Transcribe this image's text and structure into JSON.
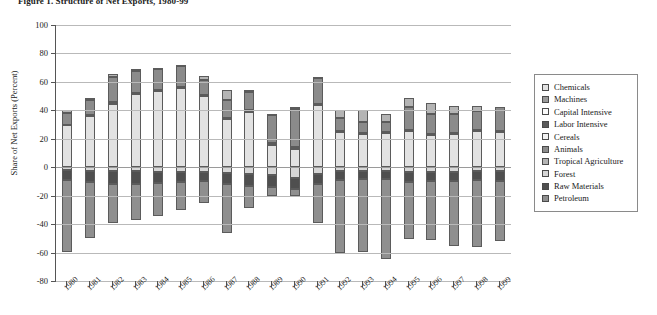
{
  "figure": {
    "title": "Figure 1. Structure of Net Exports, 1980-99"
  },
  "chart_data": {
    "type": "bar",
    "stacked": true,
    "title": "Figure 1. Structure of Net Exports, 1980-99",
    "xlabel": "",
    "ylabel": "Share of Net Exports (Percent)",
    "ylim": [
      -80,
      100
    ],
    "ytick_labels": [
      "100",
      "80",
      "60",
      "40",
      "20",
      "0",
      "-20",
      "-40",
      "-60",
      "-80"
    ],
    "yticks": [
      100,
      80,
      60,
      40,
      20,
      0,
      -20,
      -40,
      -60,
      -80
    ],
    "grid": true,
    "legend_position": "right",
    "categories": [
      "1980",
      "1981",
      "1982",
      "1983",
      "1984",
      "1985",
      "1986",
      "1987",
      "1988",
      "1989",
      "1990",
      "1991",
      "1992",
      "1993",
      "1994",
      "1995",
      "1996",
      "1997",
      "1998",
      "1999"
    ],
    "series": [
      {
        "name": "Chemicals",
        "color": "#e2e2e2",
        "values": [
          29.5,
          36.5,
          44.5,
          52.0,
          53.5,
          55.5,
          50.5,
          34.0,
          38.5,
          15.5,
          12.5,
          44.0,
          25.0,
          23.5,
          24.0,
          26.0,
          23.0,
          23.5,
          25.5,
          25.0
        ]
      },
      {
        "name": "Machines",
        "color": "#9a9a9a",
        "values": [
          0.0,
          0.0,
          0.0,
          0.0,
          0.0,
          0.0,
          0.0,
          0.0,
          0.0,
          0.0,
          0.0,
          0.0,
          0.0,
          0.0,
          0.0,
          0.0,
          0.0,
          0.0,
          0.0,
          0.0
        ]
      },
      {
        "name": "Capital Intensive",
        "color": "#fbfbfb",
        "values": [
          0.0,
          0.0,
          0.0,
          0.0,
          0.0,
          0.0,
          0.0,
          0.0,
          0.0,
          0.0,
          0.0,
          0.0,
          0.0,
          0.0,
          0.0,
          0.0,
          0.0,
          0.0,
          0.0,
          0.0
        ]
      },
      {
        "name": "Labor Intensive",
        "color": "#5a5a5a",
        "values": [
          0.0,
          0.5,
          1.5,
          0.5,
          0.5,
          1.0,
          0.5,
          0.5,
          1.5,
          1.5,
          1.5,
          0.5,
          0.5,
          0.5,
          0.5,
          0.5,
          0.5,
          0.5,
          0.5,
          0.5
        ]
      },
      {
        "name": "Cereals",
        "color": "#f2f2f2",
        "values": [
          0.0,
          0.0,
          0.0,
          0.0,
          0.0,
          0.0,
          0.0,
          0.0,
          0.0,
          0.0,
          0.0,
          0.0,
          0.0,
          0.0,
          0.0,
          0.0,
          0.0,
          0.0,
          0.0,
          0.0
        ]
      },
      {
        "name": "Animals",
        "color": "#8b8b8b",
        "values": [
          8.5,
          10.5,
          17.5,
          15.0,
          15.0,
          14.5,
          10.5,
          12.5,
          13.0,
          19.5,
          27.0,
          18.0,
          9.0,
          7.5,
          7.0,
          15.5,
          14.0,
          13.5,
          13.5,
          17.0
        ]
      },
      {
        "name": "Tropical Agriculture",
        "color": "#b4b4b4",
        "values": [
          2.0,
          1.5,
          2.0,
          1.5,
          1.0,
          1.0,
          2.5,
          7.0,
          1.5,
          1.0,
          1.0,
          1.0,
          5.5,
          8.5,
          6.0,
          7.0,
          7.5,
          5.5,
          3.5,
          0.0
        ]
      },
      {
        "name": "Forest",
        "color": "#d6d6d6",
        "values": [
          -2.0,
          -2.5,
          -2.5,
          -3.0,
          -3.5,
          -3.5,
          -3.5,
          -4.0,
          -4.5,
          -5.5,
          -7.5,
          -4.5,
          -3.0,
          -2.5,
          -3.0,
          -3.5,
          -3.5,
          -3.5,
          -3.0,
          -3.0
        ]
      },
      {
        "name": "Raw Materials",
        "color": "#4f4f4f",
        "values": [
          -7.0,
          -8.0,
          -9.5,
          -9.0,
          -7.5,
          -7.0,
          -6.5,
          -7.5,
          -9.0,
          -8.5,
          -7.5,
          -7.0,
          -6.0,
          -5.5,
          -5.0,
          -7.0,
          -6.5,
          -6.5,
          -6.0,
          -6.5
        ]
      },
      {
        "name": "Petroleum",
        "color": "#8f8f8f",
        "values": [
          -50.5,
          -39.0,
          -27.5,
          -25.0,
          -23.5,
          -19.5,
          -15.5,
          -34.5,
          -15.0,
          -6.0,
          -5.0,
          -28.0,
          -51.5,
          -51.5,
          -56.5,
          -40.0,
          -41.5,
          -45.5,
          -47.0,
          -42.5
        ]
      }
    ]
  },
  "yaxis": {
    "title": "Share of Net Exports (Percent)",
    "ticks": [
      "100",
      "80",
      "60",
      "40",
      "20",
      "0",
      "-20",
      "-40",
      "-60",
      "-80"
    ]
  },
  "xaxis": {
    "labels": [
      "1980",
      "1981",
      "1982",
      "1983",
      "1984",
      "1985",
      "1986",
      "1987",
      "1988",
      "1989",
      "1990",
      "1991",
      "1992",
      "1993",
      "1994",
      "1995",
      "1996",
      "1997",
      "1998",
      "1999"
    ]
  },
  "legend": {
    "items": [
      {
        "label": "Chemicals",
        "color": "#e2e2e2"
      },
      {
        "label": "Machines",
        "color": "#9a9a9a"
      },
      {
        "label": "Capital Intensive",
        "color": "#fbfbfb"
      },
      {
        "label": "Labor Intensive",
        "color": "#5a5a5a"
      },
      {
        "label": "Cereals",
        "color": "#f2f2f2"
      },
      {
        "label": "Animals",
        "color": "#8b8b8b"
      },
      {
        "label": "Tropical Agriculture",
        "color": "#b4b4b4"
      },
      {
        "label": "Forest",
        "color": "#d6d6d6"
      },
      {
        "label": "Raw Materials",
        "color": "#4f4f4f"
      },
      {
        "label": "Petroleum",
        "color": "#8f8f8f"
      }
    ]
  }
}
